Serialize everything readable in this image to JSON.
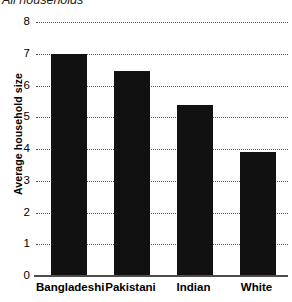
{
  "chart_data": {
    "type": "bar",
    "title": "All households",
    "categories": [
      "Bangladeshi",
      "Pakistani",
      "Indian",
      "White"
    ],
    "values": [
      7.0,
      6.45,
      5.4,
      3.9
    ],
    "xlabel": "",
    "ylabel": "Average household size",
    "ylim": [
      0,
      8
    ],
    "yticks": [
      0,
      1,
      2,
      3,
      4,
      5,
      6,
      7,
      8
    ],
    "ytick_labels": [
      "0",
      "1",
      "2",
      "3",
      "4",
      "5",
      "6",
      "7",
      "8"
    ],
    "grid": true,
    "grid_axis": "y",
    "grid_style": "dotted",
    "legend": false,
    "bar_color": "#111111",
    "axis_color": "#4d4d4d",
    "grid_color": "#5a5a5a",
    "title_style": "italic"
  }
}
